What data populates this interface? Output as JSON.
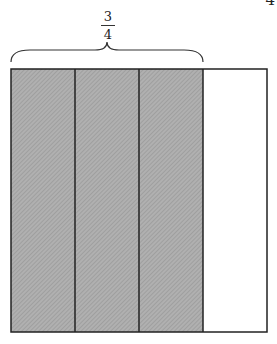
{
  "page_number": "4",
  "fraction": {
    "numerator": "3",
    "denominator": "4"
  },
  "diagram": {
    "total_parts": 4,
    "shaded_parts": 3,
    "shade_color": "#a8a8a8",
    "outline_color": "#222222"
  }
}
